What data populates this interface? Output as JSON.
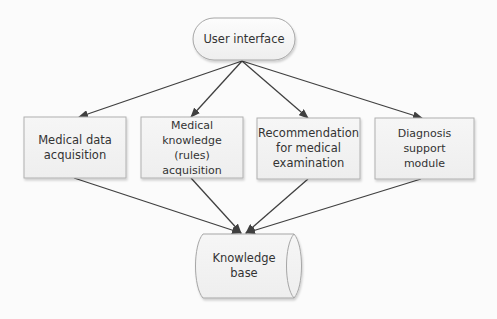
{
  "diagram": {
    "type": "flowchart",
    "colors": {
      "background": "#fbfbfb",
      "node_fill": "#f2f2f2",
      "node_border": "#a6a6a6",
      "edge": "#404040",
      "text": "#333333"
    },
    "nodes": {
      "ui": {
        "label": "User interface",
        "shape": "rounded-pill"
      },
      "acq_data": {
        "label": "Medical data acquisition",
        "line1": "Medical data",
        "line2": "acquisition",
        "shape": "rectangle"
      },
      "acq_rules": {
        "label": "Medical knowledge (rules) acquisition",
        "line1": "Medical knowledge",
        "line2": "(rules) acquisition",
        "shape": "rectangle"
      },
      "recommend": {
        "label": "Recommendation for medical examination",
        "line1": "Recommendation",
        "line2": "for medical",
        "line3": "examination",
        "shape": "rectangle"
      },
      "diagnosis": {
        "label": "Diagnosis support module",
        "line1": "Diagnosis support",
        "line2": "module",
        "shape": "rectangle"
      },
      "kb": {
        "label": "Knowledge base",
        "shape": "cylinder-horizontal"
      }
    },
    "edges": [
      {
        "from": "User interface",
        "to": "Medical data acquisition"
      },
      {
        "from": "User interface",
        "to": "Medical knowledge (rules) acquisition"
      },
      {
        "from": "User interface",
        "to": "Recommendation for medical examination"
      },
      {
        "from": "User interface",
        "to": "Diagnosis support module"
      },
      {
        "from": "Medical data acquisition",
        "to": "Knowledge base"
      },
      {
        "from": "Medical knowledge (rules) acquisition",
        "to": "Knowledge base"
      },
      {
        "from": "Recommendation for medical examination",
        "to": "Knowledge base"
      },
      {
        "from": "Diagnosis support module",
        "to": "Knowledge base"
      }
    ]
  }
}
